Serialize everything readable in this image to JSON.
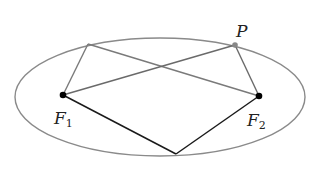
{
  "diagram": {
    "labels": {
      "p": "P",
      "f1_main": "F",
      "f1_sub": "1",
      "f2_main": "F",
      "f2_sub": "2"
    },
    "colors": {
      "ellipse": "#8a8a8a",
      "gray_lines": "#7a7a7a",
      "dark_lines": "#1a1a1a",
      "focus_dot": "#000000",
      "p_dot": "#888888"
    }
  }
}
